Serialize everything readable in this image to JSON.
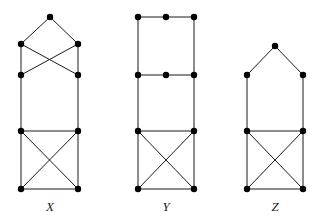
{
  "figure": {
    "background_color": "#ffffff",
    "edge_color": "#1a1a1a",
    "vertex_color": "#000000",
    "label_color": "#1a1a1a",
    "vertex_radius": 3.2,
    "edge_width": 1,
    "width": 322,
    "height": 223
  },
  "chart_data": {
    "type": "diagram",
    "subtype": "graph-drawing",
    "xlabel": "",
    "ylabel": "",
    "grid": false,
    "legend": "none",
    "xlim": [
      0,
      322
    ],
    "ylim": [
      0,
      223
    ],
    "graphs": [
      {
        "name": "X",
        "label": "X",
        "label_x": 50,
        "label_y": 211,
        "vertex_count": 7,
        "edge_count": 12,
        "vertices": [
          {
            "id": "x_apex",
            "x": 50,
            "y": 17
          },
          {
            "id": "x_ul",
            "x": 21,
            "y": 44
          },
          {
            "id": "x_ur",
            "x": 78,
            "y": 44
          },
          {
            "id": "x_ml",
            "x": 21,
            "y": 75
          },
          {
            "id": "x_mr",
            "x": 78,
            "y": 75
          },
          {
            "id": "x_bl",
            "x": 21,
            "y": 131
          },
          {
            "id": "x_br",
            "x": 78,
            "y": 131
          },
          {
            "id": "x_fl",
            "x": 21,
            "y": 189
          },
          {
            "id": "x_fr",
            "x": 78,
            "y": 189
          }
        ],
        "edges": [
          [
            "x_apex",
            "x_ul"
          ],
          [
            "x_apex",
            "x_ur"
          ],
          [
            "x_ul",
            "x_mr"
          ],
          [
            "x_ur",
            "x_ml"
          ],
          [
            "x_ul",
            "x_ml"
          ],
          [
            "x_ur",
            "x_mr"
          ],
          [
            "x_ml",
            "x_bl"
          ],
          [
            "x_mr",
            "x_br"
          ],
          [
            "x_bl",
            "x_br"
          ],
          [
            "x_bl",
            "x_fl"
          ],
          [
            "x_br",
            "x_fr"
          ],
          [
            "x_fl",
            "x_fr"
          ],
          [
            "x_bl",
            "x_fr"
          ],
          [
            "x_br",
            "x_fl"
          ]
        ]
      },
      {
        "name": "Y",
        "label": "Y",
        "label_x": 166,
        "label_y": 211,
        "vertex_count": 8,
        "edge_count": 13,
        "vertices": [
          {
            "id": "y_tl",
            "x": 138,
            "y": 17
          },
          {
            "id": "y_tc",
            "x": 166,
            "y": 17
          },
          {
            "id": "y_tr",
            "x": 194,
            "y": 17
          },
          {
            "id": "y_ml",
            "x": 138,
            "y": 75
          },
          {
            "id": "y_mc",
            "x": 166,
            "y": 75
          },
          {
            "id": "y_mr",
            "x": 194,
            "y": 75
          },
          {
            "id": "y_bl",
            "x": 138,
            "y": 131
          },
          {
            "id": "y_br",
            "x": 194,
            "y": 131
          },
          {
            "id": "y_fl",
            "x": 138,
            "y": 189
          },
          {
            "id": "y_fr",
            "x": 194,
            "y": 189
          }
        ],
        "edges": [
          [
            "y_tl",
            "y_tc"
          ],
          [
            "y_tc",
            "y_tr"
          ],
          [
            "y_tl",
            "y_ml"
          ],
          [
            "y_tr",
            "y_mr"
          ],
          [
            "y_ml",
            "y_mc"
          ],
          [
            "y_mc",
            "y_mr"
          ],
          [
            "y_ml",
            "y_bl"
          ],
          [
            "y_mr",
            "y_br"
          ],
          [
            "y_bl",
            "y_br"
          ],
          [
            "y_bl",
            "y_fl"
          ],
          [
            "y_br",
            "y_fr"
          ],
          [
            "y_fl",
            "y_fr"
          ],
          [
            "y_bl",
            "y_fr"
          ],
          [
            "y_br",
            "y_fl"
          ]
        ]
      },
      {
        "name": "Z",
        "label": "Z",
        "label_x": 275,
        "label_y": 211,
        "vertex_count": 7,
        "edge_count": 11,
        "vertices": [
          {
            "id": "z_apex",
            "x": 275,
            "y": 46
          },
          {
            "id": "z_ul",
            "x": 247,
            "y": 75
          },
          {
            "id": "z_ur",
            "x": 303,
            "y": 75
          },
          {
            "id": "z_bl",
            "x": 247,
            "y": 131
          },
          {
            "id": "z_br",
            "x": 303,
            "y": 131
          },
          {
            "id": "z_fl",
            "x": 247,
            "y": 189
          },
          {
            "id": "z_fr",
            "x": 303,
            "y": 189
          }
        ],
        "edges": [
          [
            "z_apex",
            "z_ul"
          ],
          [
            "z_apex",
            "z_ur"
          ],
          [
            "z_ul",
            "z_bl"
          ],
          [
            "z_ur",
            "z_br"
          ],
          [
            "z_bl",
            "z_br"
          ],
          [
            "z_bl",
            "z_fl"
          ],
          [
            "z_br",
            "z_fr"
          ],
          [
            "z_fl",
            "z_fr"
          ],
          [
            "z_bl",
            "z_fr"
          ],
          [
            "z_br",
            "z_fl"
          ]
        ]
      }
    ]
  }
}
